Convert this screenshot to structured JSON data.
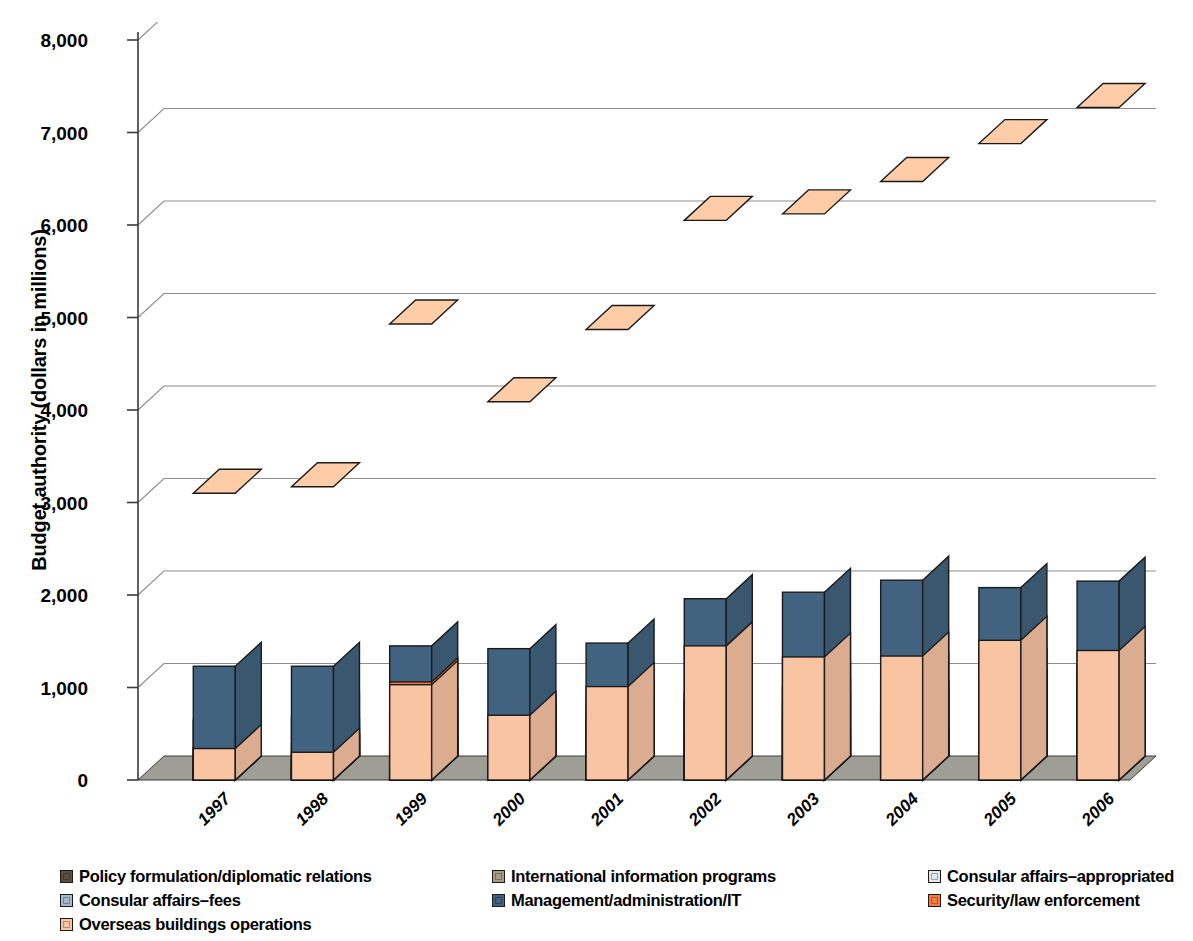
{
  "chart_data": {
    "type": "bar",
    "subtype": "stacked-column-3d",
    "title": "",
    "xlabel": "",
    "ylabel": "Budget authority (dollars in millions)",
    "ylim": [
      0,
      8000
    ],
    "ytick_values": [
      0,
      1000,
      2000,
      3000,
      4000,
      5000,
      6000,
      7000,
      8000
    ],
    "ytick_labels": [
      "0",
      "1,000",
      "2,000",
      "3,000",
      "4,000",
      "5,000",
      "6,000",
      "7,000",
      "8,000"
    ],
    "grid": true,
    "grid_axis": "y",
    "legend_position": "bottom",
    "stack_order": "bottom-to-top",
    "categories": [
      "1997",
      "1998",
      "1999",
      "2000",
      "2001",
      "2002",
      "2003",
      "2004",
      "2005",
      "2006"
    ],
    "series": [
      {
        "name": "Policy formulation/diplomatic relations",
        "color": "#5a4f42",
        "values": [
          650,
          680,
          700,
          660,
          840,
          950,
          1010,
          1110,
          1150,
          1240
        ]
      },
      {
        "name": "International information programs",
        "color": "#a79d86",
        "values": [
          350,
          400,
          390,
          330,
          330,
          290,
          220,
          300,
          300,
          340
        ]
      },
      {
        "name": "Consular affairs–appropriated",
        "color": "#e4e8ec",
        "values": [
          110,
          100,
          100,
          60,
          40,
          30,
          20,
          20,
          20,
          20
        ]
      },
      {
        "name": "Consular affairs–fees",
        "color": "#a8b8cd",
        "values": [
          160,
          230,
          200,
          360,
          510,
          510,
          680,
          740,
          920,
          1190
        ]
      },
      {
        "name": "Management/administration/IT",
        "color": "#42637f",
        "values": [
          1230,
          1230,
          1450,
          1420,
          1480,
          1960,
          2030,
          2160,
          2080,
          2150
        ]
      },
      {
        "name": "Security/law enforcement",
        "color": "#f97b3f",
        "values": [
          260,
          230,
          1060,
          560,
          660,
          860,
          830,
          800,
          900,
          930
        ]
      },
      {
        "name": "Overseas buildings operations",
        "color": "#f9c4a2",
        "values": [
          340,
          300,
          1030,
          700,
          1010,
          1450,
          1330,
          1340,
          1510,
          1400
        ]
      }
    ],
    "totals": [
      3100,
      3170,
      4930,
      4090,
      4870,
      6050,
      6120,
      6470,
      6880,
      7270
    ]
  },
  "y_axis": {
    "title": "Budget authority (dollars in millions)"
  },
  "legend": {
    "rows": [
      [
        {
          "label": "Policy formulation/diplomatic relations",
          "color": "#5a4f42",
          "x": 0
        },
        {
          "label": "International information programs",
          "color": "#a79d86",
          "x": 432
        },
        {
          "label": "Consular affairs–appropriated",
          "color": "#e4e8ec",
          "x": 868
        }
      ],
      [
        {
          "label": "Consular affairs–fees",
          "color": "#a8b8cd",
          "x": 0
        },
        {
          "label": "Management/administration/IT",
          "color": "#42637f",
          "x": 432
        },
        {
          "label": "Security/law enforcement",
          "color": "#f97b3f",
          "x": 868
        }
      ],
      [
        {
          "label": "Overseas buildings operations",
          "color": "#f9c4a2",
          "x": 0
        }
      ]
    ]
  },
  "colors": {
    "floor": "#9e9e96",
    "floor_light": "#c9c9c1",
    "gridline": "#8d8d8d",
    "axis": "#3a3a3a",
    "outline": "#1a1a1a",
    "background": "#ffffff"
  }
}
